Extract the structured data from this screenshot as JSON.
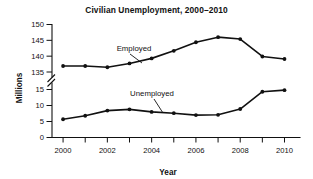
{
  "chart_data": {
    "type": "line",
    "title": "Civilian Unemployment, 2000–2010",
    "xlabel": "Year",
    "ylabel": "Millions",
    "x": [
      2000,
      2001,
      2002,
      2003,
      2004,
      2005,
      2006,
      2007,
      2008,
      2009,
      2010
    ],
    "x_tick_labels": [
      "2000",
      "2002",
      "2004",
      "2006",
      "2008",
      "2010"
    ],
    "xlim": [
      1999.5,
      2010.7
    ],
    "y_broken_axis": true,
    "y_tick_labels_lower": [
      "0",
      "5",
      "10",
      "15"
    ],
    "y_tick_labels_upper": [
      "135",
      "140",
      "145",
      "150"
    ],
    "ylim_lower": [
      0,
      15
    ],
    "ylim_upper": [
      135,
      150
    ],
    "grid": false,
    "legend_position": "inline-annotations",
    "series": [
      {
        "name": "Employed",
        "values": [
          136.9,
          136.9,
          136.5,
          137.7,
          139.3,
          141.7,
          144.4,
          146.0,
          145.4,
          139.9,
          139.1
        ]
      },
      {
        "name": "Unemployed",
        "values": [
          5.7,
          6.8,
          8.4,
          8.8,
          8.0,
          7.6,
          7.0,
          7.1,
          8.9,
          14.3,
          14.8
        ]
      }
    ],
    "annotations": [
      {
        "text": "Employed",
        "points_to_year": 2004
      },
      {
        "text": "Unemployed",
        "points_to_year": 2005
      }
    ]
  }
}
